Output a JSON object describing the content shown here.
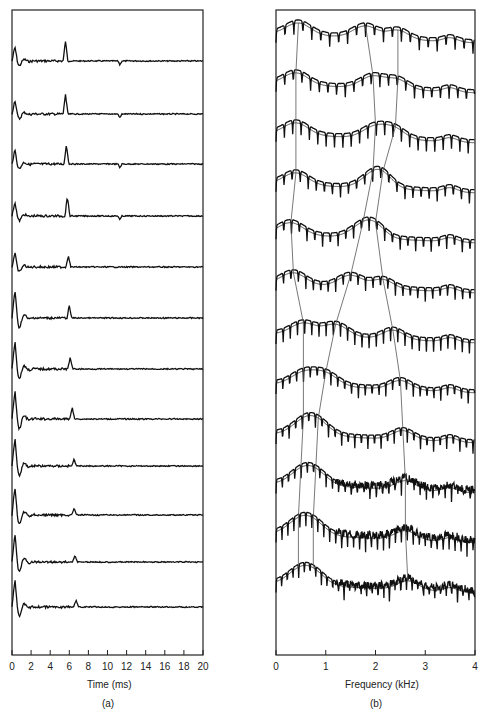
{
  "figure": {
    "panel_a": {
      "label": "(a)",
      "xlabel": "Time (ms)",
      "xticks": [
        "0",
        "2",
        "4",
        "6",
        "8",
        "10",
        "12",
        "14",
        "16",
        "18",
        "20"
      ],
      "xlim": [
        0,
        20
      ],
      "trace_count": 12
    },
    "panel_b": {
      "label": "(b)",
      "xlabel": "Frequency (kHz)",
      "xticks": [
        "0",
        "1",
        "2",
        "3",
        "4"
      ],
      "xlim": [
        0,
        4
      ],
      "trace_count": 12
    }
  },
  "chart_data": [
    {
      "type": "line",
      "title": "(a)",
      "xlabel": "Time (ms)",
      "ylabel": "",
      "xlim": [
        0,
        20
      ],
      "grid": false,
      "description": "Stacked cepstra (12 frames, top to bottom) showing pitch-pulse peak near 5.6–6.6 ms",
      "series": [
        {
          "name": "frame 1",
          "pitch_peak_ms": 5.6
        },
        {
          "name": "frame 2",
          "pitch_peak_ms": 5.6
        },
        {
          "name": "frame 3",
          "pitch_peak_ms": 5.7
        },
        {
          "name": "frame 4",
          "pitch_peak_ms": 5.8
        },
        {
          "name": "frame 5",
          "pitch_peak_ms": 5.9
        },
        {
          "name": "frame 6",
          "pitch_peak_ms": 6.0
        },
        {
          "name": "frame 7",
          "pitch_peak_ms": 6.1
        },
        {
          "name": "frame 8",
          "pitch_peak_ms": 6.3
        },
        {
          "name": "frame 9",
          "pitch_peak_ms": 6.5
        },
        {
          "name": "frame 10",
          "pitch_peak_ms": 6.5
        },
        {
          "name": "frame 11",
          "pitch_peak_ms": 6.6
        },
        {
          "name": "frame 12",
          "pitch_peak_ms": 6.7
        }
      ]
    },
    {
      "type": "line",
      "title": "(b)",
      "xlabel": "Frequency (kHz)",
      "ylabel": "",
      "xlim": [
        0,
        4
      ],
      "grid": false,
      "description": "Stacked log spectra with smoothed envelopes (12 frames); thin lines track formants F1, F2, F3 across frames",
      "formant_tracks_khz": {
        "F1": [
          0.45,
          0.4,
          0.4,
          0.4,
          0.3,
          0.35,
          0.55,
          0.55,
          0.55,
          0.5,
          0.45,
          0.45
        ],
        "F2": [
          1.8,
          1.95,
          2.0,
          1.95,
          1.75,
          1.5,
          1.2,
          1.0,
          0.85,
          0.8,
          0.75,
          0.75
        ],
        "F3": [
          2.45,
          2.45,
          2.4,
          2.15,
          2.0,
          2.15,
          2.35,
          2.5,
          2.55,
          2.6,
          2.6,
          2.65
        ]
      }
    }
  ]
}
